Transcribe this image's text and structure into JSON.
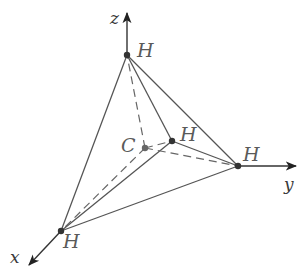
{
  "diagram": {
    "colors": {
      "line": "#555555",
      "dash": "#666666",
      "axis": "#333333",
      "vertex": "#333333",
      "label": "#5a5a5a"
    },
    "axes": {
      "x": {
        "label": "x"
      },
      "y": {
        "label": "y"
      },
      "z": {
        "label": "z"
      }
    },
    "atoms": {
      "top": {
        "label": "H"
      },
      "inner": {
        "label": "H"
      },
      "right": {
        "label": "H"
      },
      "bottom": {
        "label": "H"
      },
      "center": {
        "label": "C"
      }
    }
  }
}
